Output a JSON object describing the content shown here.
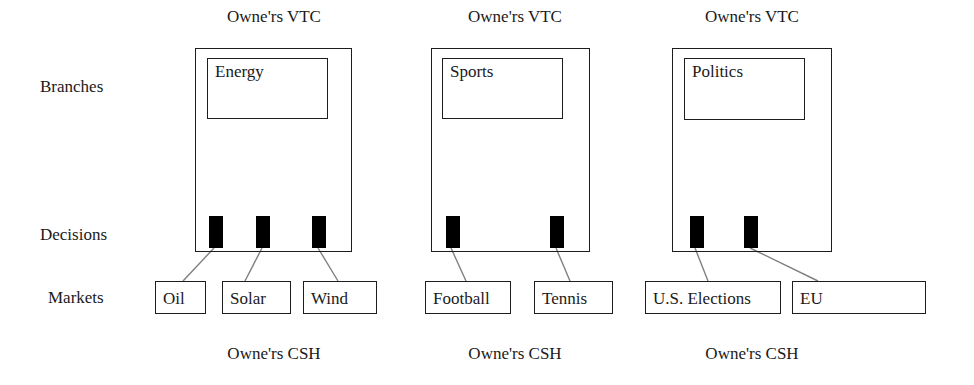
{
  "diagram": {
    "background_color": "#ffffff",
    "line_color": "#1d1d1d",
    "connector_color": "#808080",
    "decision_color": "#000000"
  },
  "row_labels": [
    {
      "id": "branches",
      "label": "Branches",
      "x": 40,
      "y": 78
    },
    {
      "id": "decisions",
      "label": "Decisions",
      "x": 40,
      "y": 226
    },
    {
      "id": "markets",
      "label": "Markets",
      "x": 48,
      "y": 289
    }
  ],
  "columns": [
    {
      "id": "energy",
      "top_caption": "Owne'rs VTC",
      "bottom_caption": "Owne'rs CSH",
      "caption_center_x": 274,
      "top_caption_y": 8,
      "bottom_caption_y": 345,
      "box": {
        "x": 195,
        "y": 48,
        "width": 157,
        "height": 204
      },
      "inner": {
        "x": 207,
        "y": 58,
        "width": 121,
        "height": 61,
        "label": "Energy"
      },
      "decisions": [
        {
          "id": "energy-d1",
          "x": 209,
          "y": 216,
          "width": 14,
          "height": 32
        },
        {
          "id": "energy-d2",
          "x": 256,
          "y": 216,
          "width": 14,
          "height": 32
        },
        {
          "id": "energy-d3",
          "x": 312,
          "y": 216,
          "width": 14,
          "height": 32
        }
      ],
      "markets": [
        {
          "id": "oil",
          "label": "Oil",
          "x": 155,
          "y": 281,
          "width": 51,
          "height": 33
        },
        {
          "id": "solar",
          "label": "Solar",
          "x": 222,
          "y": 281,
          "width": 69,
          "height": 33
        },
        {
          "id": "wind",
          "label": "Wind",
          "x": 303,
          "y": 281,
          "width": 74,
          "height": 33
        }
      ],
      "connectors": [
        {
          "x1": 214,
          "y1": 248,
          "x2": 183,
          "y2": 281
        },
        {
          "x1": 262,
          "y1": 248,
          "x2": 245,
          "y2": 281
        },
        {
          "x1": 318,
          "y1": 248,
          "x2": 338,
          "y2": 281
        }
      ]
    },
    {
      "id": "sports",
      "top_caption": "Owne'rs VTC",
      "bottom_caption": "Owne'rs CSH",
      "caption_center_x": 515,
      "top_caption_y": 8,
      "bottom_caption_y": 345,
      "box": {
        "x": 431,
        "y": 48,
        "width": 159,
        "height": 204
      },
      "inner": {
        "x": 442,
        "y": 58,
        "width": 121,
        "height": 61,
        "label": "Sports"
      },
      "decisions": [
        {
          "id": "sports-d1",
          "x": 446,
          "y": 216,
          "width": 14,
          "height": 32
        },
        {
          "id": "sports-d2",
          "x": 550,
          "y": 216,
          "width": 14,
          "height": 32
        }
      ],
      "markets": [
        {
          "id": "football",
          "label": "Football",
          "x": 425,
          "y": 281,
          "width": 86,
          "height": 33
        },
        {
          "id": "tennis",
          "label": "Tennis",
          "x": 534,
          "y": 281,
          "width": 79,
          "height": 33
        }
      ],
      "connectors": [
        {
          "x1": 451,
          "y1": 248,
          "x2": 466,
          "y2": 281
        },
        {
          "x1": 556,
          "y1": 248,
          "x2": 570,
          "y2": 281
        }
      ]
    },
    {
      "id": "politics",
      "top_caption": "Owne'rs VTC",
      "bottom_caption": "Owne'rs CSH",
      "caption_center_x": 752,
      "top_caption_y": 8,
      "bottom_caption_y": 345,
      "box": {
        "x": 672,
        "y": 48,
        "width": 160,
        "height": 204
      },
      "inner": {
        "x": 684,
        "y": 58,
        "width": 121,
        "height": 62,
        "label": "Politics"
      },
      "decisions": [
        {
          "id": "politics-d1",
          "x": 690,
          "y": 216,
          "width": 14,
          "height": 32
        },
        {
          "id": "politics-d2",
          "x": 744,
          "y": 216,
          "width": 14,
          "height": 32
        }
      ],
      "markets": [
        {
          "id": "us-elections",
          "label": "U.S. Elections",
          "x": 645,
          "y": 281,
          "width": 136,
          "height": 33
        },
        {
          "id": "eu",
          "label": "EU",
          "x": 792,
          "y": 281,
          "width": 134,
          "height": 33
        }
      ],
      "connectors": [
        {
          "x1": 695,
          "y1": 248,
          "x2": 708,
          "y2": 281
        },
        {
          "x1": 750,
          "y1": 248,
          "x2": 818,
          "y2": 281
        }
      ]
    }
  ]
}
